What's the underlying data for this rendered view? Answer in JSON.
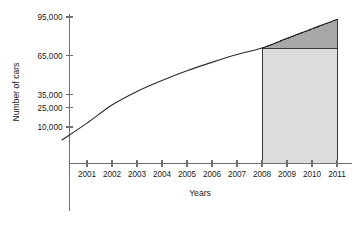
{
  "chart_data": {
    "type": "line",
    "title": "",
    "xlabel": "Years",
    "ylabel": "Number of cars",
    "grid": false,
    "legend": "none",
    "x": [
      2000,
      2001,
      2002,
      2003,
      2004,
      2005,
      2006,
      2007,
      2008,
      2009,
      2010,
      2011
    ],
    "x_tick_labels": [
      "2001",
      "2002",
      "2003",
      "2004",
      "2005",
      "2006",
      "2007",
      "2008",
      "2009",
      "2010",
      "2011"
    ],
    "x_ticks": [
      2001,
      2002,
      2003,
      2004,
      2005,
      2006,
      2007,
      2008,
      2009,
      2010,
      2011
    ],
    "xlim": [
      2000,
      2011
    ],
    "y_tick_labels": [
      "95,000",
      "65,000",
      "35,000",
      "25,000",
      "10,000"
    ],
    "y_ticks": [
      95000,
      65000,
      35000,
      25000,
      10000
    ],
    "ylim": [
      0,
      100000
    ],
    "series": [
      {
        "name": "Number of cars",
        "values": [
          0,
          13000,
          27000,
          37500,
          46000,
          53500,
          60000,
          66000,
          71000,
          78500,
          86000,
          93000
        ],
        "color": "#2b2b2b"
      }
    ],
    "annotations": [
      {
        "name": "shaded-rectangle",
        "shape": "rectangle",
        "x_start": 2008,
        "x_end": 2011,
        "y_start": 0,
        "y_end": 71000,
        "color": "#dcdcdc",
        "label": ""
      },
      {
        "name": "shaded-triangle",
        "shape": "triangle",
        "x_start": 2008,
        "x_end": 2011,
        "y_base": 71000,
        "y_peak": 93000,
        "color": "#a8a8a8",
        "label": ""
      }
    ]
  }
}
